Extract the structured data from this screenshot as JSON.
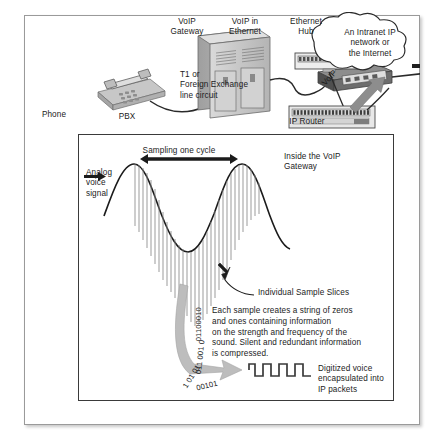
{
  "figure": {
    "top_section": {
      "phone_label": "Phone",
      "pbx_label": "PBX",
      "voip_gateway_label": "VoIP\nGateway",
      "trunk_label": "T1 or\nForeign Exchange\nline circuit",
      "voip_in_ethernet_label": "VoIP in\nEthernet",
      "ethernet_hub_label": "Ethernet\nHub",
      "ip_router_label": "IP Router",
      "voip_arrow_label": "VoIP",
      "cloud_label": "An Intranet IP\nnetwork or\nthe Internet"
    },
    "bottom_section": {
      "inside_gateway_label": "Inside the VoIP\nGateway",
      "analog_signal_label": "Analog\nvoice\nsignal",
      "sampling_label": "Sampling one cycle",
      "sample_slices_label": "Individual Sample Slices",
      "explanation_text": "Each sample creates a string of zeros\nand ones containing information\non the strength and frequency of the\nsound. Silent and redundant information\nis compressed.",
      "binary_stream_1": "01100010",
      "binary_stream_2": "011 001 0",
      "binary_stream_3": "1 01 01",
      "binary_stream_4": "00101",
      "digitized_label": "Digitized voice\nencapsulated into\nIP packets"
    },
    "colors": {
      "ink": "#1b1b1b",
      "frame": "#9a9a9a",
      "panel_border": "#3a3a3a",
      "device_fill": "#c9c9c9",
      "device_shade": "#a8a8a8",
      "arrow_gray": "#8d8d8d"
    }
  }
}
